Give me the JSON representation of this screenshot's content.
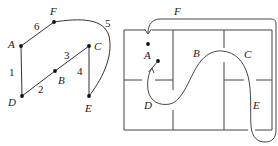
{
  "graph": {
    "vertices": [
      {
        "id": "A",
        "label": "A",
        "x": 21,
        "y": 46,
        "lx": 8,
        "ly": 48
      },
      {
        "id": "F",
        "label": "F",
        "x": 54,
        "y": 22,
        "lx": 50,
        "ly": 15
      },
      {
        "id": "C",
        "label": "C",
        "x": 89,
        "y": 46,
        "lx": 94,
        "ly": 50
      },
      {
        "id": "B",
        "label": "B",
        "x": 55,
        "y": 71,
        "lx": 58,
        "ly": 84
      },
      {
        "id": "D",
        "label": "D",
        "x": 22,
        "y": 96,
        "lx": 8,
        "ly": 106
      },
      {
        "id": "E",
        "label": "E",
        "x": 89,
        "y": 96,
        "lx": 85,
        "ly": 112
      }
    ],
    "edges": [
      {
        "id": "1",
        "from": "A",
        "to": "D",
        "label": "1",
        "lx": 9,
        "ly": 76
      },
      {
        "id": "2",
        "from": "D",
        "to": "B",
        "label": "2",
        "lx": 38,
        "ly": 93
      },
      {
        "id": "3",
        "from": "B",
        "to": "C",
        "label": "3",
        "lx": 64,
        "ly": 59
      },
      {
        "id": "4",
        "from": "C",
        "to": "E",
        "label": "4",
        "lx": 77,
        "ly": 75
      },
      {
        "id": "5",
        "from": "F",
        "to": "E",
        "label": "5",
        "curved": true,
        "lx": 105,
        "ly": 27
      },
      {
        "id": "6",
        "from": "A",
        "to": "F",
        "label": "6",
        "lx": 34,
        "ly": 30
      }
    ]
  },
  "floorplan": {
    "rooms": [
      {
        "id": "A",
        "label": "A",
        "lx": 144,
        "ly": 59
      },
      {
        "id": "B",
        "label": "B",
        "lx": 193,
        "ly": 57
      },
      {
        "id": "C",
        "label": "C",
        "lx": 244,
        "ly": 58
      },
      {
        "id": "D",
        "label": "D",
        "lx": 144,
        "ly": 109
      },
      {
        "id": "E",
        "label": "E",
        "lx": 253,
        "ly": 109
      },
      {
        "id": "F",
        "label": "F",
        "lx": 174,
        "ly": 15
      }
    ],
    "start_dot": {
      "x": 158,
      "y": 61
    },
    "end_dot": {
      "x": 148,
      "y": 44
    }
  },
  "colors": {
    "line": "#333333",
    "background": "#ffffff"
  }
}
